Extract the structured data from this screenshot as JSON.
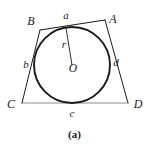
{
  "figure": {
    "caption": "(a)",
    "stroke_color": "#1a1a1a",
    "baseline_color": "#8c8c8c",
    "background_color": "#ffffff",
    "circle": {
      "center_label": "O",
      "radius_label": "r",
      "cx": 72,
      "cy": 65,
      "r": 38
    },
    "vertices": [
      {
        "label": "A",
        "x": 105,
        "y": 20,
        "label_x": 113,
        "label_y": 19
      },
      {
        "label": "B",
        "x": 40,
        "y": 30,
        "label_x": 31,
        "label_y": 21
      },
      {
        "label": "C",
        "x": 22,
        "y": 103,
        "label_x": 11,
        "label_y": 104
      },
      {
        "label": "D",
        "x": 128,
        "y": 103,
        "label_x": 138,
        "label_y": 104
      }
    ],
    "sides": [
      {
        "label": "a",
        "from": "B",
        "to": "A",
        "label_x": 66,
        "label_y": 15
      },
      {
        "label": "b",
        "from": "B",
        "to": "C",
        "label_x": 26,
        "label_y": 64
      },
      {
        "label": "c",
        "from": "C",
        "to": "D",
        "label_x": 72,
        "label_y": 113
      },
      {
        "label": "d",
        "from": "A",
        "to": "D",
        "label_x": 116,
        "label_y": 62
      }
    ],
    "radius_segment": {
      "from_x": 72,
      "from_y": 65,
      "to_x": 66,
      "to_y": 28,
      "label": "r",
      "label_x": 64,
      "label_y": 44
    },
    "center_label_position": {
      "x": 73,
      "y": 69
    }
  }
}
